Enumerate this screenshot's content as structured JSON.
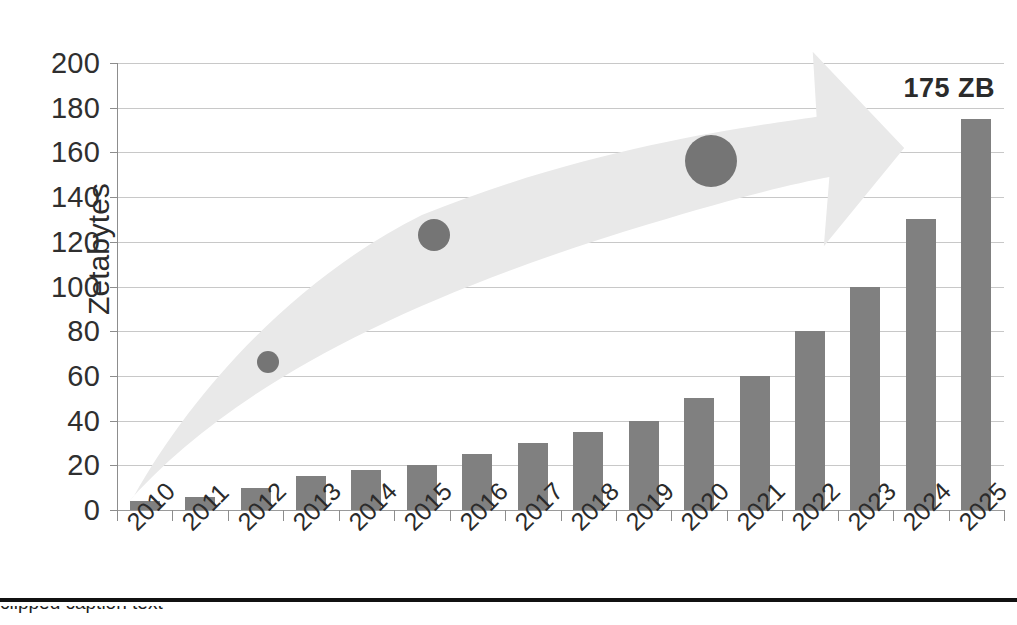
{
  "chart_data": {
    "type": "bar",
    "title": "",
    "xlabel": "",
    "ylabel": "Zetabytes",
    "ylim": [
      0,
      200
    ],
    "ytick_step": 20,
    "yticks": [
      "200",
      "180",
      "160",
      "140",
      "120",
      "100",
      "80",
      "60",
      "40",
      "20",
      "0"
    ],
    "ytick_values": [
      200,
      180,
      160,
      140,
      120,
      100,
      80,
      60,
      40,
      20,
      0
    ],
    "grid": "horizontal",
    "legend": "none",
    "categories": [
      "2010",
      "2011",
      "2012",
      "2013",
      "2014",
      "2015",
      "2016",
      "2017",
      "2018",
      "2019",
      "2020",
      "2021",
      "2022",
      "2023",
      "2024",
      "2025"
    ],
    "values": [
      4,
      6,
      10,
      15,
      18,
      20,
      25,
      30,
      35,
      40,
      50,
      60,
      80,
      100,
      130,
      175
    ],
    "series": [
      {
        "name": "Global datasphere",
        "values": [
          4,
          6,
          10,
          15,
          18,
          20,
          25,
          30,
          35,
          40,
          50,
          60,
          80,
          100,
          130,
          175
        ]
      }
    ],
    "annotations": [
      {
        "name": "end-value-callout",
        "text": "175 ZB",
        "x": "2025",
        "y": 175
      }
    ],
    "overlay_markers": [
      {
        "name": "growth-bubble-small",
        "x": "2012",
        "y": 66,
        "size_px": 22
      },
      {
        "name": "growth-bubble-medium",
        "x": "2015",
        "y": 123,
        "size_px": 32
      },
      {
        "name": "growth-bubble-large",
        "x": "2020",
        "y": 156,
        "size_px": 52
      }
    ],
    "overlay_shape": {
      "name": "growth-arrow",
      "direction": "up-right",
      "color": "#e9e9e9"
    },
    "colors": {
      "bar": "#808080",
      "arrow": "#e9e9e9",
      "bubble": "#757575",
      "grid": "#c8c8c8",
      "axis": "#8d8d8d",
      "text": "#2b2b2b",
      "rule": "#111111"
    }
  },
  "footer": {
    "rule_visible": true,
    "caption_text": "clipped caption text"
  }
}
